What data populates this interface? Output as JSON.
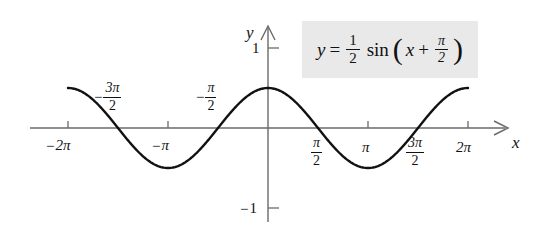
{
  "figure": {
    "title": "",
    "equation_text": "y = 1/2 sin(x + pi/2)",
    "equation": {
      "lhs": "y",
      "equals": "=",
      "coefficient_numerator": "1",
      "coefficient_denominator": "2",
      "function": "sin",
      "open_paren": "(",
      "argument_variable": "x",
      "plus": "+",
      "phase_numerator": "π",
      "phase_denominator": "2",
      "close_paren": ")"
    },
    "box_color": "#e9e9e9",
    "curve_color": "#111111",
    "axis_color": "#5a5a5a"
  },
  "axes": {
    "x_axis_label": "x",
    "y_axis_label": "y",
    "x_tick_labels": [
      {
        "text": "-2π",
        "sign": "−",
        "symbol": "2π",
        "value": -6.2832
      },
      {
        "text": "-3π/2",
        "sign": "−",
        "numerator": "3π",
        "denominator": "2",
        "value": -4.7124
      },
      {
        "text": "-π",
        "sign": "−",
        "symbol": "π",
        "value": -3.1416
      },
      {
        "text": "-π/2",
        "sign": "−",
        "numerator": "π",
        "denominator": "2",
        "value": -1.5708
      },
      {
        "text": "π/2",
        "sign": "",
        "numerator": "π",
        "denominator": "2",
        "value": 1.5708
      },
      {
        "text": "π",
        "sign": "",
        "symbol": "π",
        "value": 3.1416
      },
      {
        "text": "3π/2",
        "sign": "",
        "numerator": "3π",
        "denominator": "2",
        "value": 4.7124
      },
      {
        "text": "2π",
        "sign": "",
        "symbol": "2π",
        "value": 6.2832
      }
    ],
    "y_tick_labels": [
      {
        "text": "1",
        "value": 1
      },
      {
        "text": "-1",
        "sign": "−",
        "magnitude": "1",
        "value": -1
      }
    ]
  },
  "chart_data": {
    "type": "line",
    "title": "",
    "subtitle": "",
    "xlabel": "x",
    "ylabel": "y",
    "xlim": [
      -6.2832,
      6.2832
    ],
    "ylim": [
      -1.0,
      1.0
    ],
    "grid": false,
    "legend": false,
    "annotations": [
      {
        "text": "y = 1/2 sin(x + pi/2)",
        "x": 4.3,
        "y": 0.95,
        "style": "gray-box"
      }
    ],
    "xticks": [
      -6.2832,
      -4.7124,
      -3.1416,
      -1.5708,
      1.5708,
      3.1416,
      4.7124,
      6.2832
    ],
    "xticklabels": [
      "-2π",
      "-3π/2",
      "-π",
      "-π/2",
      "π/2",
      "π",
      "3π/2",
      "2π"
    ],
    "yticks": [
      1,
      -1
    ],
    "yticklabels": [
      "1",
      "-1"
    ],
    "series": [
      {
        "name": "y = 1/2 sin(x + pi/2)",
        "function": "0.5*sin(x + pi/2)",
        "amplitude": 0.5,
        "period": 6.2832,
        "phase_shift": 1.5708,
        "vertical_shift": 0,
        "color": "#111111",
        "linewidth": 2.4,
        "key_points": [
          {
            "x": -6.2832,
            "y": 0.5,
            "type": "maximum"
          },
          {
            "x": -4.7124,
            "y": 0.0,
            "type": "zero"
          },
          {
            "x": -3.1416,
            "y": -0.5,
            "type": "minimum"
          },
          {
            "x": -1.5708,
            "y": 0.0,
            "type": "zero"
          },
          {
            "x": 0.0,
            "y": 0.5,
            "type": "maximum"
          },
          {
            "x": 1.5708,
            "y": 0.0,
            "type": "zero"
          },
          {
            "x": 3.1416,
            "y": -0.5,
            "type": "minimum"
          },
          {
            "x": 4.7124,
            "y": 0.0,
            "type": "zero"
          },
          {
            "x": 6.2832,
            "y": 0.5,
            "type": "maximum"
          }
        ],
        "x": [
          -6.2832,
          -5.8905,
          -5.4978,
          -5.1051,
          -4.7124,
          -4.3197,
          -3.927,
          -3.5343,
          -3.1416,
          -2.7489,
          -2.3562,
          -1.9635,
          -1.5708,
          -1.1781,
          -0.7854,
          -0.3927,
          0,
          0.3927,
          0.7854,
          1.1781,
          1.5708,
          1.9635,
          2.3562,
          2.7489,
          3.1416,
          3.5343,
          3.927,
          4.3197,
          4.7124,
          5.1051,
          5.4978,
          5.8905,
          6.2832
        ],
        "y": [
          0.5,
          0.4619,
          0.3536,
          0.1913,
          0,
          -0.1913,
          -0.3536,
          -0.4619,
          -0.5,
          -0.4619,
          -0.3536,
          -0.1913,
          0,
          0.1913,
          0.3536,
          0.4619,
          0.5,
          0.4619,
          0.3536,
          0.1913,
          0,
          -0.1913,
          -0.3536,
          -0.4619,
          -0.5,
          -0.4619,
          -0.3536,
          -0.1913,
          0,
          0.1913,
          0.3536,
          0.4619,
          0.5
        ]
      }
    ]
  }
}
